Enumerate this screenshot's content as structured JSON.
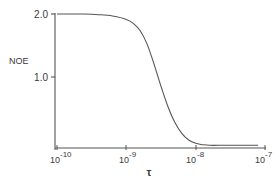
{
  "chart_data": {
    "type": "line",
    "title": "",
    "xlabel": "τ",
    "ylabel": "NOE",
    "x_scale": "log",
    "xlim": [
      1e-10,
      1e-07
    ],
    "ylim": [
      0,
      2.0
    ],
    "grid": false,
    "legend": null,
    "x_ticks": [
      {
        "value": 1e-10,
        "base": "10",
        "exp": "-10"
      },
      {
        "value": 1e-09,
        "base": "10",
        "exp": "-9"
      },
      {
        "value": 1e-08,
        "base": "10",
        "exp": "-8"
      },
      {
        "value": 1e-07,
        "base": "10",
        "exp": "-7"
      }
    ],
    "y_ticks": [
      {
        "value": 2.0,
        "label": "2.0"
      },
      {
        "value": 1.0,
        "label": "1.0"
      }
    ],
    "series": [
      {
        "name": "NOE",
        "x_log10": [
          -10.0,
          -9.8,
          -9.6,
          -9.4,
          -9.2,
          -9.0,
          -8.9,
          -8.8,
          -8.7,
          -8.6,
          -8.5,
          -8.4,
          -8.3,
          -8.2,
          -8.1,
          -8.0,
          -7.9,
          -7.8,
          -7.6,
          -7.4,
          -7.1
        ],
        "y": [
          2.0,
          2.0,
          2.0,
          1.99,
          1.97,
          1.92,
          1.86,
          1.75,
          1.55,
          1.25,
          0.92,
          0.62,
          0.38,
          0.22,
          0.12,
          0.07,
          0.05,
          0.04,
          0.04,
          0.04,
          0.04
        ]
      }
    ]
  },
  "labels": {
    "ylabel": "NOE",
    "xlabel": "τ",
    "y2": "2.0",
    "y1": "1.0",
    "x0_base": "10",
    "x0_exp": "-10",
    "x1_base": "10",
    "x1_exp": "-9",
    "x2_base": "10",
    "x2_exp": "-8",
    "x3_base": "10",
    "x3_exp": "-7"
  }
}
